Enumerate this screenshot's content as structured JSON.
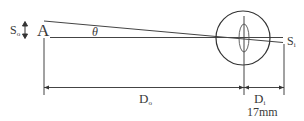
{
  "diagram": {
    "object_letter": "A",
    "object_size_label": "S",
    "object_size_sub": "o",
    "angle_label": "θ",
    "image_size_label": "S",
    "image_size_sub": "i",
    "object_distance_label": "D",
    "object_distance_sub": "o",
    "image_distance_label": "D",
    "image_distance_sub": "i",
    "image_distance_value": "17mm"
  }
}
